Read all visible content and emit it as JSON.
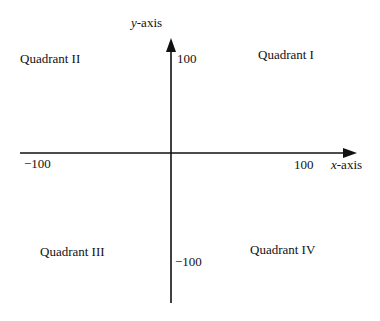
{
  "diagram": {
    "axes": {
      "x_label_var": "x",
      "x_label_rest": "-axis",
      "y_label_var": "y",
      "y_label_rest": "-axis",
      "x_max": "100",
      "x_min": "−100",
      "y_max": "100",
      "y_min": "−100"
    },
    "quadrants": {
      "q1": "Quadrant I",
      "q2": "Quadrant II",
      "q3": "Quadrant III",
      "q4": "Quadrant IV"
    },
    "colors": {
      "ink": "#111111",
      "background": "#ffffff"
    }
  }
}
